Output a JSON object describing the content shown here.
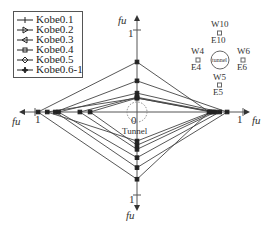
{
  "legend": [
    {
      "label": "Kobe0.1",
      "marker": "plus"
    },
    {
      "label": "Kobe0.2",
      "marker": "triangle-right"
    },
    {
      "label": "Kobe0.3",
      "marker": "triangle-left"
    },
    {
      "label": "Kobe0.4",
      "marker": "square"
    },
    {
      "label": "Kobe0.5",
      "marker": "diamond"
    },
    {
      "label": "Kobe0.6-1",
      "marker": "star"
    }
  ],
  "axes": {
    "label": "fu",
    "tick_value": "1",
    "origin_label": "0",
    "center_label": "Tunnel"
  },
  "inset": {
    "tunnel_label": "tunnel",
    "top": {
      "upper": "W10",
      "lower": "E10"
    },
    "left": {
      "upper": "W4",
      "lower": "E4"
    },
    "right": {
      "upper": "W6",
      "lower": "E6"
    },
    "bottom": {
      "upper": "W5",
      "lower": "E5"
    }
  },
  "chart_data": {
    "type": "radar",
    "axes": [
      "top (W10/E10)",
      "right (W6/E6)",
      "bottom (W5/E5)",
      "left (W4/E4)"
    ],
    "range": [
      0,
      1
    ],
    "series": [
      {
        "name": "Kobe0.1",
        "values": [
          0.17,
          0.7,
          0.35,
          0.88
        ]
      },
      {
        "name": "Kobe0.2",
        "values": [
          0.17,
          0.72,
          0.4,
          0.46
        ]
      },
      {
        "name": "Kobe0.3",
        "values": [
          0.18,
          0.74,
          0.45,
          0.56
        ]
      },
      {
        "name": "Kobe0.4",
        "values": [
          0.23,
          0.78,
          0.55,
          0.77
        ]
      },
      {
        "name": "Kobe0.5",
        "values": [
          0.38,
          0.85,
          0.67,
          0.8
        ]
      },
      {
        "name": "Kobe0.6-1",
        "values": [
          0.61,
          0.68,
          0.81,
          0.97
        ]
      }
    ]
  }
}
